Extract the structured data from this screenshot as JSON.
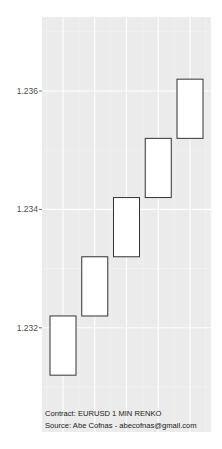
{
  "chart_data": {
    "type": "renko",
    "title": "",
    "xlabel": "",
    "ylabel": "",
    "ylim": [
      1.23024,
      1.23725
    ],
    "y_ticks": [
      1.232,
      1.234,
      1.236
    ],
    "y_tick_labels": [
      "1.232",
      "1.234",
      "1.236"
    ],
    "y_minor_ticks": [
      1.231,
      1.233,
      1.235,
      1.237
    ],
    "grid": true,
    "legend": null,
    "brick_size": 0.001,
    "bricks": [
      {
        "index": 1,
        "low": 1.2312,
        "high": 1.2322,
        "direction": "up"
      },
      {
        "index": 2,
        "low": 1.2322,
        "high": 1.2332,
        "direction": "up"
      },
      {
        "index": 3,
        "low": 1.2332,
        "high": 1.2342,
        "direction": "up"
      },
      {
        "index": 4,
        "low": 1.2342,
        "high": 1.2352,
        "direction": "up"
      },
      {
        "index": 5,
        "low": 1.2352,
        "high": 1.2362,
        "direction": "up"
      }
    ],
    "annotations": [
      "Contract: EURUSD 1 MIN RENKO",
      "Source: Abe Cofnas - abecofnas@gmail.com"
    ]
  },
  "colors": {
    "panel_background": "#ebebeb",
    "grid_major": "#ffffff",
    "grid_minor": "#f5f5f5",
    "brick_fill": "#ffffff",
    "brick_border": "#333333",
    "tick_label": "#4d4d4d"
  },
  "caption": {
    "line1": "Contract: EURUSD 1 MIN RENKO",
    "line2": "Source: Abe Cofnas - abecofnas@gmail.com"
  }
}
